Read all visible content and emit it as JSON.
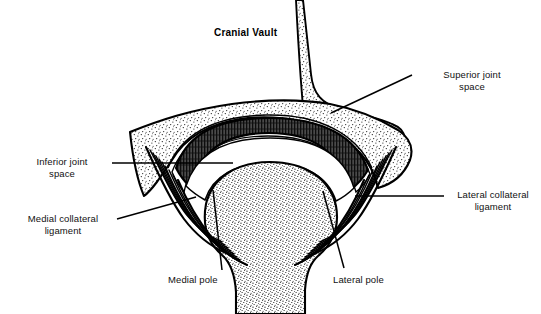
{
  "figure": {
    "title": "Cranial Vault",
    "background_color": "#ffffff",
    "ink_color": "#000000"
  },
  "labels": [
    {
      "id": "cranial-vault",
      "text": "Cranial Vault",
      "bold": true,
      "align": "left",
      "x": 214,
      "y": 27,
      "leader": null
    },
    {
      "id": "superior-joint-space",
      "text": "Superior joint\nspace",
      "bold": false,
      "align": "left",
      "x": 417,
      "y": 69,
      "leader": {
        "x1": 412,
        "y1": 75,
        "x2": 331,
        "y2": 113
      }
    },
    {
      "id": "lateral-collateral-ligament",
      "text": "Lateral collateral\nligament",
      "bold": false,
      "align": "left",
      "x": 446,
      "y": 189,
      "leader": {
        "x1": 444,
        "y1": 196,
        "x2": 355,
        "y2": 196
      }
    },
    {
      "id": "inferior-joint-space",
      "text": "Inferior joint\nspace",
      "bold": false,
      "align": "right",
      "x": 30,
      "y": 156,
      "leader": {
        "x1": 112,
        "y1": 163,
        "x2": 233,
        "y2": 163
      }
    },
    {
      "id": "medial-collateral-ligament",
      "text": "Medial collateral\nligament",
      "bold": false,
      "align": "right",
      "x": 16,
      "y": 213,
      "leader": {
        "x1": 117,
        "y1": 219,
        "x2": 196,
        "y2": 197
      }
    },
    {
      "id": "medial-pole",
      "text": "Medial pole",
      "bold": false,
      "align": "left",
      "x": 168,
      "y": 274,
      "leader": {
        "x1": 222,
        "y1": 270,
        "x2": 213,
        "y2": 190
      }
    },
    {
      "id": "lateral-pole",
      "text": "Lateral pole",
      "bold": false,
      "align": "left",
      "x": 333,
      "y": 274,
      "leader": {
        "x1": 344,
        "y1": 268,
        "x2": 323,
        "y2": 191
      }
    }
  ],
  "structures": [
    {
      "id": "cranial-vault-column",
      "name": "Cranial vault (stippled bone column)"
    },
    {
      "id": "temporal-bone",
      "name": "Temporal bone / glenoid fossa"
    },
    {
      "id": "articular-disc",
      "name": "Articular disc (hatched band)"
    },
    {
      "id": "superior-joint-space-cavity",
      "name": "Superior joint space"
    },
    {
      "id": "inferior-joint-space-cavity",
      "name": "Inferior joint space"
    },
    {
      "id": "mandibular-condyle",
      "name": "Mandibular condyle (stippled)"
    },
    {
      "id": "condylar-neck",
      "name": "Condylar neck"
    },
    {
      "id": "medial-collateral-fibers",
      "name": "Medial collateral ligament fibers"
    },
    {
      "id": "lateral-collateral-fibers",
      "name": "Lateral collateral ligament fibers"
    }
  ]
}
